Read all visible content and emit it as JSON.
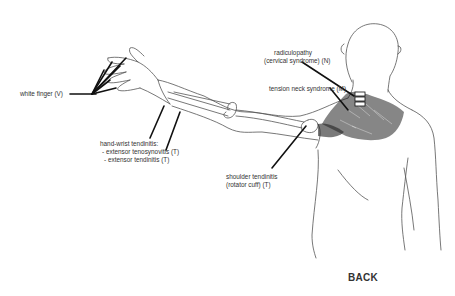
{
  "diagram": {
    "view_label": "BACK",
    "labels": {
      "white_finger": "white finger (V)",
      "hand_wrist_heading": "hand-wrist tendinitis:",
      "extensor_tenosynovitis": "- extensor tenosynovitis (T)",
      "extensor_tendinitis": "- extensor tendinitis (T)",
      "radiculopathy_line1": "radiculopathy",
      "radiculopathy_line2": "(cervical syndrome) (N)",
      "tension_neck": "tension neck syndrome (M)",
      "shoulder_line1": "shoulder tendinitis",
      "shoulder_line2": "(rotator cuff) (T)"
    },
    "colors": {
      "line": "#444444",
      "leader": "#111111",
      "text": "#333333"
    }
  }
}
